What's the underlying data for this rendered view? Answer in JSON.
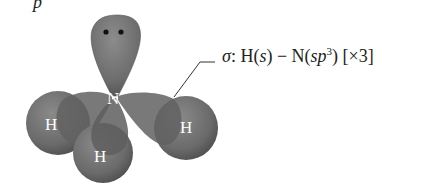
{
  "figure": {
    "top_fragment": "p",
    "molecule": "NH3",
    "atoms": {
      "central": "N",
      "hydrogens": [
        "H",
        "H",
        "H"
      ]
    },
    "lone_pair": "••",
    "annotation": {
      "sigma": "σ",
      "colon": ":",
      "h_part": "H(",
      "h_orbital": "s",
      "h_close": ")",
      "dash": " − ",
      "n_part": "N(",
      "n_orbital": "sp",
      "n_sup": "3",
      "n_close": ")",
      "multiplier": " [×3]"
    },
    "colors": {
      "orbital": "#6f6f6f",
      "orbital_dark": "#4a4a4a",
      "text": "#222222",
      "background": "#ffffff"
    }
  }
}
